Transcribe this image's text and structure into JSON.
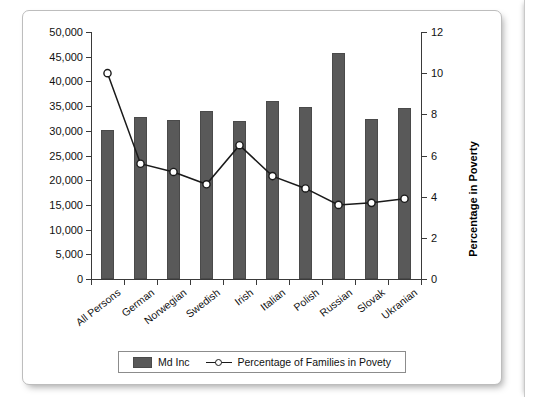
{
  "chart_data": {
    "type": "bar",
    "title": "",
    "categories": [
      "All Persons",
      "German",
      "Norwegian",
      "Swedish",
      "Irish",
      "Italian",
      "Polish",
      "Russian",
      "Slovak",
      "Ukranian"
    ],
    "series": [
      {
        "name": "Md Inc",
        "type": "bar",
        "axis": "left",
        "values": [
          30100,
          32800,
          32200,
          34000,
          32000,
          36100,
          34800,
          45800,
          32400,
          34600
        ]
      },
      {
        "name": "Percentage of Families in Povety",
        "type": "line",
        "axis": "right",
        "values": [
          10.0,
          5.6,
          5.2,
          4.6,
          6.5,
          5.0,
          4.4,
          3.6,
          3.7,
          3.9
        ]
      }
    ],
    "xlabel": "",
    "ylabel": "Income",
    "ylabel_right": "Percentage in Poverty",
    "ylim": [
      0,
      50000
    ],
    "ylim_right": [
      0,
      12
    ],
    "yticks": [
      0,
      5000,
      10000,
      15000,
      20000,
      25000,
      30000,
      35000,
      40000,
      45000,
      50000
    ],
    "ytick_labels": [
      "0",
      "5,000",
      "10,000",
      "15,000",
      "20,000",
      "25,000",
      "30,000",
      "35,000",
      "40,000",
      "45,000",
      "50,000"
    ],
    "yticks_right": [
      0,
      2,
      4,
      6,
      8,
      10,
      12
    ],
    "ytick_labels_right": [
      "0",
      "2",
      "4",
      "6",
      "8",
      "10",
      "12"
    ],
    "grid": false,
    "legend_position": "bottom",
    "colors": {
      "bar": "#595959",
      "line": "#1a1a1a",
      "marker_fill": "#ffffff",
      "axis": "#3a3a3a",
      "panel_bg": "#ffffff"
    }
  },
  "legend": {
    "items": [
      {
        "label": "Md Inc",
        "marker": "bar-swatch"
      },
      {
        "label": "Percentage of Families in Povety",
        "marker": "line-circle-marker"
      }
    ]
  }
}
